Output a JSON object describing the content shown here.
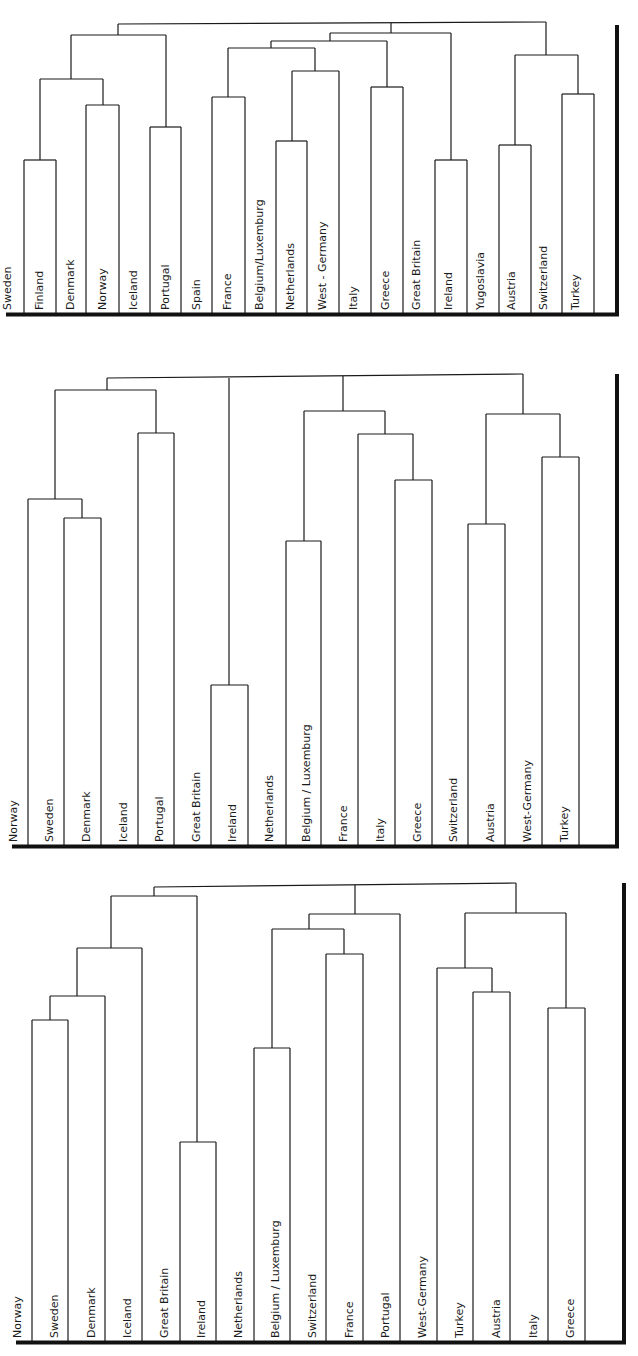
{
  "figure": {
    "line_color": "#1a1a1a",
    "axis_color": "#111111"
  },
  "panels": [
    {
      "name": "dendrogram-top",
      "top": 0,
      "height": 318,
      "baseline_y": 313,
      "axis": {
        "x": 617,
        "y1": 25,
        "y2": 316
      },
      "leaves": [
        {
          "label": "Sweden",
          "x": 16,
          "label_x": 8
        },
        {
          "label": "Finland",
          "x": 24,
          "label_x": 40
        },
        {
          "label": "Denmark",
          "x": 56,
          "label_x": 71
        },
        {
          "label": "Norway",
          "x": 86,
          "label_x": 103
        },
        {
          "label": "Iceland",
          "x": 119,
          "label_x": 134
        },
        {
          "label": "Portugal",
          "x": 150,
          "label_x": 166
        },
        {
          "label": "Spain",
          "x": 181,
          "label_x": 197
        },
        {
          "label": "France",
          "x": 212,
          "label_x": 228
        },
        {
          "label": "Belgium/Luxemburg",
          "x": 245,
          "label_x": 260
        },
        {
          "label": "Netherlands",
          "x": 276,
          "label_x": 291
        },
        {
          "label": "West - Germany",
          "x": 307,
          "label_x": 323
        },
        {
          "label": "Italy",
          "x": 339,
          "label_x": 354
        },
        {
          "label": "Greece",
          "x": 371,
          "label_x": 386
        },
        {
          "label": "Great Britain",
          "x": 403,
          "label_x": 417
        },
        {
          "label": "Ireland",
          "x": 435,
          "label_x": 449
        },
        {
          "label": "Yugoslavia",
          "x": 467,
          "label_x": 481
        },
        {
          "label": "Austria",
          "x": 499,
          "label_x": 512
        },
        {
          "label": "Switzerland",
          "x": 531,
          "label_x": 544
        },
        {
          "label": "Turkey",
          "x": 562,
          "label_x": 576
        }
      ],
      "segments": [
        [
          24,
          313,
          24,
          160
        ],
        [
          56,
          313,
          56,
          160
        ],
        [
          24,
          160,
          56,
          160
        ],
        [
          86,
          313,
          86,
          105
        ],
        [
          119,
          313,
          119,
          105
        ],
        [
          86,
          105,
          119,
          105
        ],
        [
          150,
          313,
          150,
          127
        ],
        [
          181,
          313,
          181,
          127
        ],
        [
          150,
          127,
          181,
          127
        ],
        [
          212,
          313,
          212,
          97
        ],
        [
          245,
          313,
          245,
          97
        ],
        [
          212,
          97,
          245,
          97
        ],
        [
          276,
          313,
          276,
          141
        ],
        [
          307,
          313,
          307,
          141
        ],
        [
          276,
          141,
          307,
          141
        ],
        [
          339,
          313,
          339,
          71
        ],
        [
          292,
          141,
          292,
          71
        ],
        [
          292,
          71,
          339,
          71
        ],
        [
          371,
          313,
          371,
          87
        ],
        [
          403,
          313,
          403,
          87
        ],
        [
          371,
          87,
          403,
          87
        ],
        [
          435,
          313,
          435,
          160
        ],
        [
          467,
          313,
          467,
          160
        ],
        [
          435,
          160,
          467,
          160
        ],
        [
          499,
          313,
          499,
          145
        ],
        [
          531,
          313,
          531,
          145
        ],
        [
          499,
          145,
          531,
          145
        ],
        [
          562,
          313,
          562,
          94
        ],
        [
          594,
          313,
          594,
          94
        ],
        [
          562,
          94,
          594,
          94
        ],
        [
          40,
          160,
          40,
          79
        ],
        [
          103,
          105,
          103,
          79
        ],
        [
          40,
          79,
          103,
          79
        ],
        [
          71,
          79,
          71,
          35
        ],
        [
          166,
          127,
          166,
          35
        ],
        [
          71,
          35,
          166,
          35
        ],
        [
          228,
          97,
          228,
          48
        ],
        [
          315,
          71,
          315,
          48
        ],
        [
          228,
          48,
          315,
          48
        ],
        [
          271,
          48,
          271,
          41
        ],
        [
          387,
          87,
          387,
          41
        ],
        [
          271,
          41,
          387,
          41
        ],
        [
          330,
          41,
          330,
          33
        ],
        [
          451,
          160,
          451,
          33
        ],
        [
          330,
          33,
          451,
          33
        ],
        [
          515,
          145,
          515,
          55
        ],
        [
          578,
          94,
          578,
          55
        ],
        [
          515,
          55,
          578,
          55
        ],
        [
          118,
          35,
          118,
          24
        ],
        [
          546,
          55,
          546,
          22
        ],
        [
          118,
          24,
          546,
          22
        ],
        [
          391,
          33,
          391,
          23
        ]
      ]
    },
    {
      "name": "dendrogram-middle",
      "top": 360,
      "height": 490,
      "baseline_y": 845,
      "axis": {
        "x": 617,
        "y1": 374,
        "y2": 847
      },
      "leaves": [
        {
          "label": "Norway",
          "x": 28,
          "label_x": 14
        },
        {
          "label": "Sweden",
          "x": 64,
          "label_x": 50
        },
        {
          "label": "Denmark",
          "x": 101,
          "label_x": 87
        },
        {
          "label": "Iceland",
          "x": 138,
          "label_x": 124
        },
        {
          "label": "Portugal",
          "x": 174,
          "label_x": 160
        },
        {
          "label": "Great Britain",
          "x": 211,
          "label_x": 197
        },
        {
          "label": "Ireland",
          "x": 248,
          "label_x": 233
        },
        {
          "label": "Netherlands",
          "x": 286,
          "label_x": 270
        },
        {
          "label": "Belgium / Luxemburg",
          "x": 321,
          "label_x": 307
        },
        {
          "label": "France",
          "x": 358,
          "label_x": 344
        },
        {
          "label": "Italy",
          "x": 395,
          "label_x": 381
        },
        {
          "label": "Greece",
          "x": 432,
          "label_x": 418
        },
        {
          "label": "Switzerland",
          "x": 468,
          "label_x": 454
        },
        {
          "label": "Austria",
          "x": 505,
          "label_x": 491
        },
        {
          "label": "West-Germany",
          "x": 542,
          "label_x": 528
        },
        {
          "label": "Turkey",
          "x": 579,
          "label_x": 565
        }
      ],
      "segments": [
        [
          28,
          845,
          28,
          499
        ],
        [
          64,
          845,
          64,
          518
        ],
        [
          101,
          845,
          101,
          518
        ],
        [
          64,
          518,
          101,
          518
        ],
        [
          82,
          518,
          82,
          499
        ],
        [
          28,
          499,
          82,
          499
        ],
        [
          138,
          845,
          138,
          433
        ],
        [
          174,
          845,
          174,
          433
        ],
        [
          138,
          433,
          174,
          433
        ],
        [
          55,
          499,
          55,
          390
        ],
        [
          156,
          433,
          156,
          390
        ],
        [
          55,
          390,
          156,
          390
        ],
        [
          211,
          845,
          211,
          685
        ],
        [
          248,
          845,
          248,
          685
        ],
        [
          211,
          685,
          248,
          685
        ],
        [
          286,
          845,
          286,
          541
        ],
        [
          321,
          845,
          321,
          541
        ],
        [
          286,
          541,
          321,
          541
        ],
        [
          358,
          845,
          358,
          434
        ],
        [
          395,
          845,
          395,
          480
        ],
        [
          432,
          845,
          432,
          480
        ],
        [
          395,
          480,
          432,
          480
        ],
        [
          413,
          480,
          413,
          434
        ],
        [
          358,
          434,
          413,
          434
        ],
        [
          304,
          541,
          304,
          411
        ],
        [
          385,
          434,
          385,
          411
        ],
        [
          304,
          411,
          385,
          411
        ],
        [
          468,
          845,
          468,
          524
        ],
        [
          505,
          845,
          505,
          524
        ],
        [
          468,
          524,
          505,
          524
        ],
        [
          542,
          845,
          542,
          457
        ],
        [
          579,
          845,
          579,
          457
        ],
        [
          542,
          457,
          579,
          457
        ],
        [
          486,
          524,
          486,
          414
        ],
        [
          560,
          457,
          560,
          414
        ],
        [
          486,
          414,
          560,
          414
        ],
        [
          107,
          390,
          107,
          378
        ],
        [
          229,
          685,
          229,
          378
        ],
        [
          343,
          411,
          343,
          376
        ],
        [
          523,
          414,
          523,
          374
        ],
        [
          107,
          378,
          523,
          374
        ]
      ]
    },
    {
      "name": "dendrogram-bottom",
      "top": 870,
      "height": 486,
      "baseline_y": 1341,
      "axis": {
        "x": 624,
        "y1": 883,
        "y2": 1343
      },
      "leaves": [
        {
          "label": "Norway",
          "x": 32,
          "label_x": 18
        },
        {
          "label": "Sweden",
          "x": 68,
          "label_x": 55
        },
        {
          "label": "Denmark",
          "x": 105,
          "label_x": 92
        },
        {
          "label": "Iceland",
          "x": 142,
          "label_x": 128
        },
        {
          "label": "Great Britain",
          "x": 180,
          "label_x": 165
        },
        {
          "label": "Ireland",
          "x": 216,
          "label_x": 202
        },
        {
          "label": "Netherlands",
          "x": 254,
          "label_x": 239
        },
        {
          "label": "Belgium / Luxemburg",
          "x": 290,
          "label_x": 276
        },
        {
          "label": "Switzerland",
          "x": 326,
          "label_x": 313
        },
        {
          "label": "France",
          "x": 363,
          "label_x": 350
        },
        {
          "label": "Portugal",
          "x": 400,
          "label_x": 386
        },
        {
          "label": "West-Germany",
          "x": 437,
          "label_x": 423
        },
        {
          "label": "Turkey",
          "x": 473,
          "label_x": 460
        },
        {
          "label": "Austria",
          "x": 510,
          "label_x": 497
        },
        {
          "label": "Italy",
          "x": 548,
          "label_x": 534
        },
        {
          "label": "Greece",
          "x": 585,
          "label_x": 571
        }
      ],
      "segments": [
        [
          32,
          1341,
          32,
          1020
        ],
        [
          68,
          1341,
          68,
          1020
        ],
        [
          32,
          1020,
          68,
          1020
        ],
        [
          50,
          1020,
          50,
          996
        ],
        [
          105,
          1341,
          105,
          996
        ],
        [
          50,
          996,
          105,
          996
        ],
        [
          77,
          996,
          77,
          948
        ],
        [
          142,
          1341,
          142,
          948
        ],
        [
          77,
          948,
          142,
          948
        ],
        [
          180,
          1341,
          180,
          1142
        ],
        [
          216,
          1341,
          216,
          1142
        ],
        [
          180,
          1142,
          216,
          1142
        ],
        [
          111,
          948,
          111,
          896
        ],
        [
          197,
          1142,
          197,
          896
        ],
        [
          111,
          896,
          197,
          896
        ],
        [
          254,
          1341,
          254,
          1048
        ],
        [
          290,
          1341,
          290,
          1048
        ],
        [
          254,
          1048,
          290,
          1048
        ],
        [
          326,
          1341,
          326,
          954
        ],
        [
          363,
          1341,
          363,
          954
        ],
        [
          326,
          954,
          363,
          954
        ],
        [
          272,
          1048,
          272,
          929
        ],
        [
          344,
          954,
          344,
          929
        ],
        [
          272,
          929,
          344,
          929
        ],
        [
          309,
          929,
          309,
          914
        ],
        [
          400,
          1341,
          400,
          914
        ],
        [
          309,
          914,
          400,
          914
        ],
        [
          437,
          1341,
          437,
          968
        ],
        [
          473,
          1341,
          473,
          992
        ],
        [
          510,
          1341,
          510,
          992
        ],
        [
          473,
          992,
          510,
          992
        ],
        [
          492,
          992,
          492,
          968
        ],
        [
          437,
          968,
          492,
          968
        ],
        [
          548,
          1341,
          548,
          1008
        ],
        [
          585,
          1341,
          585,
          1008
        ],
        [
          548,
          1008,
          585,
          1008
        ],
        [
          465,
          968,
          465,
          913
        ],
        [
          566,
          1008,
          566,
          913
        ],
        [
          465,
          913,
          566,
          913
        ],
        [
          154,
          896,
          154,
          887
        ],
        [
          355,
          914,
          355,
          885
        ],
        [
          516,
          913,
          516,
          883
        ],
        [
          154,
          887,
          516,
          883
        ]
      ]
    }
  ],
  "chart_data": [
    {
      "type": "dendrogram",
      "title": "",
      "leaves": [
        "Sweden",
        "Finland",
        "Denmark",
        "Norway",
        "Iceland",
        "Portugal",
        "Spain",
        "France",
        "Belgium/Luxemburg",
        "Netherlands",
        "West - Germany",
        "Italy",
        "Greece",
        "Great Britain",
        "Ireland",
        "Yugoslavia",
        "Austria",
        "Switzerland",
        "Turkey"
      ],
      "clusters": [
        [
          "Finland",
          "Denmark"
        ],
        [
          "Norway",
          "Iceland"
        ],
        [
          "Portugal",
          "Spain"
        ],
        [
          "France",
          "Belgium/Luxemburg"
        ],
        [
          "Netherlands",
          "West - Germany"
        ],
        [
          "Greece",
          "Great Britain"
        ],
        [
          "Ireland",
          "Yugoslavia"
        ],
        [
          "Austria",
          "Switzerland"
        ],
        [
          "Turkey",
          "(end)"
        ]
      ]
    },
    {
      "type": "dendrogram",
      "title": "",
      "leaves": [
        "Norway",
        "Sweden",
        "Denmark",
        "Iceland",
        "Portugal",
        "Great Britain",
        "Ireland",
        "Netherlands",
        "Belgium / Luxemburg",
        "France",
        "Italy",
        "Greece",
        "Switzerland",
        "Austria",
        "West-Germany",
        "Turkey"
      ]
    },
    {
      "type": "dendrogram",
      "title": "",
      "leaves": [
        "Norway",
        "Sweden",
        "Denmark",
        "Iceland",
        "Great Britain",
        "Ireland",
        "Netherlands",
        "Belgium / Luxemburg",
        "Switzerland",
        "France",
        "Portugal",
        "West-Germany",
        "Turkey",
        "Austria",
        "Italy",
        "Greece"
      ]
    }
  ]
}
